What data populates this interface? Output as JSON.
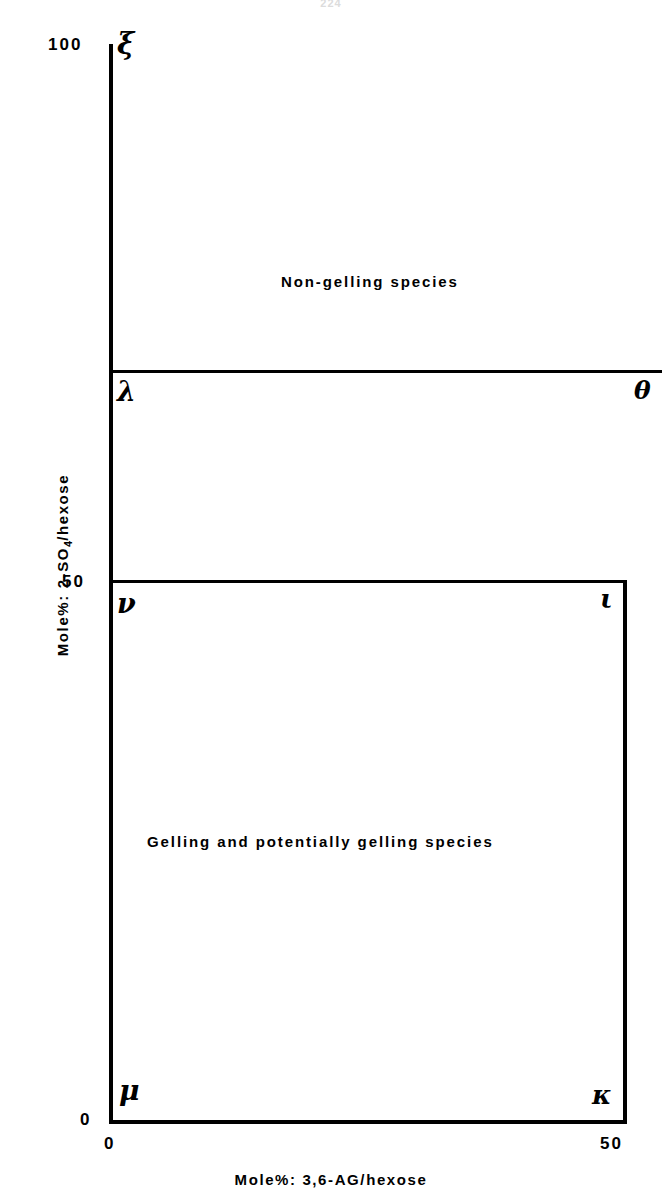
{
  "figure": {
    "running_head": "224",
    "background_color": "#ffffff",
    "ink_color": "#000000"
  },
  "axes": {
    "y": {
      "title_prefix": "Mole%: 2-SO",
      "title_subscript": "4",
      "title_suffix": "/hexose",
      "title_full": "Mole%: 2-SO4/hexose",
      "ticks": [
        {
          "value": 100,
          "label": "100"
        },
        {
          "value": 50,
          "label": "50"
        },
        {
          "value": 0,
          "label": "0"
        }
      ],
      "range": [
        0,
        100
      ]
    },
    "x": {
      "title_full": "Mole%: 3,6-AG/hexose",
      "ticks": [
        {
          "value": 0,
          "label": "0"
        },
        {
          "value": 50,
          "label": "50"
        }
      ],
      "range": [
        0,
        50
      ]
    }
  },
  "regions": [
    {
      "id": "non-gelling",
      "label": "Non-gelling species"
    },
    {
      "id": "gelling",
      "label": "Gelling and potentially gelling species"
    }
  ],
  "markers": [
    {
      "id": "xi",
      "glyph": "ξ",
      "name": "xi"
    },
    {
      "id": "lambda",
      "glyph": "λ",
      "name": "lambda"
    },
    {
      "id": "theta",
      "glyph": "θ",
      "name": "theta"
    },
    {
      "id": "nu",
      "glyph": "ν",
      "name": "nu"
    },
    {
      "id": "iota",
      "glyph": "ι",
      "name": "iota"
    },
    {
      "id": "mu",
      "glyph": "μ",
      "name": "mu"
    },
    {
      "id": "kappa",
      "glyph": "κ",
      "name": "kappa"
    }
  ],
  "chart_data": {
    "type": "scatter",
    "title": "",
    "xlabel": "Mole%: 3,6-AG/hexose",
    "ylabel": "Mole%: 2-SO4/hexose",
    "xlim": [
      0,
      50
    ],
    "ylim": [
      0,
      100
    ],
    "grid": false,
    "legend": "none",
    "xticks": [
      0,
      50
    ],
    "xticklabels": [
      "0",
      "50"
    ],
    "yticks": [
      0,
      50,
      100
    ],
    "yticklabels": [
      "0",
      "50",
      "100"
    ],
    "points": [
      {
        "label": "ξ",
        "name": "xi",
        "x": 0,
        "y": 100
      },
      {
        "label": "λ",
        "name": "lambda",
        "x": 0,
        "y": 72
      },
      {
        "label": "θ",
        "name": "theta",
        "x": 50,
        "y": 72
      },
      {
        "label": "ν",
        "name": "nu",
        "x": 0,
        "y": 50
      },
      {
        "label": "ι",
        "name": "iota",
        "x": 50,
        "y": 50
      },
      {
        "label": "μ",
        "name": "mu",
        "x": 0,
        "y": 0
      },
      {
        "label": "κ",
        "name": "kappa",
        "x": 50,
        "y": 0
      }
    ],
    "lines": [
      {
        "name": "lambda-theta divider",
        "x": [
          0,
          50
        ],
        "y": [
          72,
          72
        ]
      },
      {
        "name": "gelling box top edge",
        "x": [
          0,
          50
        ],
        "y": [
          50,
          50
        ]
      },
      {
        "name": "gelling box right edge",
        "x": [
          50,
          50
        ],
        "y": [
          0,
          50
        ]
      }
    ],
    "annotations": [
      {
        "text": "Non-gelling species",
        "x": 22,
        "y": 82
      },
      {
        "text": "Gelling and potentially gelling species",
        "x": 25,
        "y": 26
      }
    ]
  }
}
